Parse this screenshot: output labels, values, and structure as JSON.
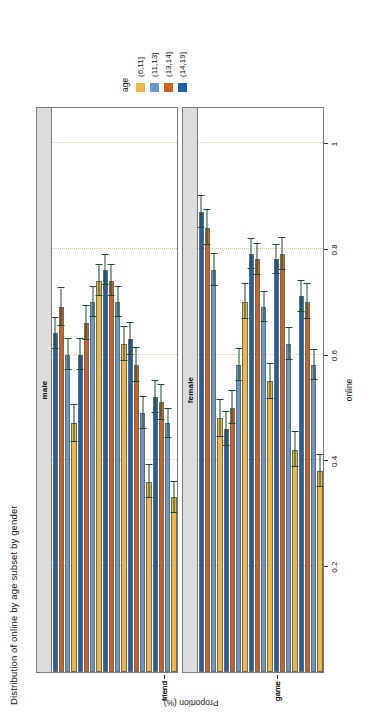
{
  "chart_data": {
    "type": "bar",
    "orientation": "horizontal",
    "title": "Distribution of online by age subset by gender",
    "xlabel": "online",
    "ylabel": "Proportion (%)",
    "categories": [
      "friend",
      "game",
      "video",
      "music",
      "school"
    ],
    "legend": {
      "title": "age",
      "position": "right",
      "entries": [
        {
          "label": "(6,11]",
          "color": "#edb740"
        },
        {
          "label": "(11,13]",
          "color": "#6699cc"
        },
        {
          "label": "(13,14]",
          "color": "#d2601a"
        },
        {
          "label": "(14,19]",
          "color": "#1f5fa9"
        }
      ]
    },
    "value_axis": {
      "ticks": [
        0.2,
        0.4,
        0.6,
        0.8,
        1
      ],
      "tick_labels": [
        "0.2",
        "0.4",
        "0.6",
        "0.8",
        "1"
      ],
      "lim": [
        0,
        1.07
      ],
      "grid": true
    },
    "panels": [
      {
        "label": "male",
        "series": [
          {
            "name": "(6,11]",
            "color": "#edb740",
            "values": [
              0.47,
              0.74,
              0.62,
              0.36,
              0.33
            ],
            "err": [
              0.035,
              0.03,
              0.033,
              0.032,
              0.03
            ]
          },
          {
            "name": "(11,13]",
            "color": "#6699cc",
            "values": [
              0.6,
              0.7,
              0.7,
              0.49,
              0.47
            ],
            "err": [
              0.03,
              0.028,
              0.028,
              0.03,
              0.028
            ]
          },
          {
            "name": "(13,14]",
            "color": "#d2601a",
            "values": [
              0.69,
              0.66,
              0.74,
              0.58,
              0.51
            ],
            "err": [
              0.035,
              0.032,
              0.03,
              0.032,
              0.033
            ]
          },
          {
            "name": "(14,19]",
            "color": "#1f5fa9",
            "values": [
              0.64,
              0.6,
              0.76,
              0.63,
              0.52
            ],
            "err": [
              0.03,
              0.03,
              0.028,
              0.03,
              0.03
            ]
          }
        ]
      },
      {
        "label": "female",
        "series": [
          {
            "name": "(6,11]",
            "color": "#edb740",
            "values": [
              0.48,
              0.7,
              0.55,
              0.42,
              0.38
            ],
            "err": [
              0.035,
              0.033,
              0.033,
              0.033,
              0.03
            ]
          },
          {
            "name": "(11,13]",
            "color": "#6699cc",
            "values": [
              0.76,
              0.58,
              0.69,
              0.62,
              0.58
            ],
            "err": [
              0.03,
              0.03,
              0.028,
              0.03,
              0.028
            ]
          },
          {
            "name": "(13,14]",
            "color": "#d2601a",
            "values": [
              0.84,
              0.5,
              0.78,
              0.79,
              0.7
            ],
            "err": [
              0.033,
              0.032,
              0.03,
              0.03,
              0.033
            ]
          },
          {
            "name": "(14,19]",
            "color": "#1f5fa9",
            "values": [
              0.87,
              0.46,
              0.79,
              0.78,
              0.71
            ],
            "err": [
              0.03,
              0.032,
              0.028,
              0.028,
              0.03
            ]
          }
        ]
      }
    ]
  }
}
